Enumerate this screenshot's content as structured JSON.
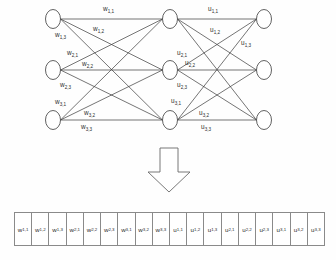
{
  "diagram": {
    "title_text": "",
    "type": "neural-network-weight-flattening",
    "colors": {
      "background": "#fefefe",
      "stroke": "#3a3a3a",
      "arrow_stroke": "#6a6a6a",
      "text": "#2b2b2b",
      "cell_border": "#8a8a8a"
    },
    "layers": [
      {
        "name": "input-layer",
        "node_count": 3,
        "x": 53,
        "nodes_y": [
          19,
          70,
          120
        ]
      },
      {
        "name": "hidden-layer",
        "node_count": 3,
        "x": 170,
        "nodes_y": [
          19,
          70,
          120
        ]
      },
      {
        "name": "output-layer",
        "node_count": 3,
        "x": 264,
        "nodes_y": [
          19,
          70,
          120
        ]
      }
    ],
    "node_radius": {
      "rx": 7.5,
      "ry": 9.5
    },
    "weight_labels_left": [
      {
        "base": "w",
        "sub": "1,1",
        "x": 103,
        "y": 6
      },
      {
        "base": "w",
        "sub": "1,2",
        "x": 93,
        "y": 26
      },
      {
        "base": "w",
        "sub": "1,3",
        "x": 55,
        "y": 32
      },
      {
        "base": "w",
        "sub": "2,1",
        "x": 67,
        "y": 50
      },
      {
        "base": "w",
        "sub": "2,2",
        "x": 82,
        "y": 61
      },
      {
        "base": "w",
        "sub": "2,3",
        "x": 60,
        "y": 82
      },
      {
        "base": "w",
        "sub": "3,1",
        "x": 55,
        "y": 99
      },
      {
        "base": "w",
        "sub": "3,2",
        "x": 84,
        "y": 110
      },
      {
        "base": "w",
        "sub": "3,3",
        "x": 81,
        "y": 124
      }
    ],
    "weight_labels_right": [
      {
        "base": "u",
        "sub": "1,1",
        "x": 208,
        "y": 6
      },
      {
        "base": "u",
        "sub": "1,2",
        "x": 210,
        "y": 27
      },
      {
        "base": "u",
        "sub": "1,3",
        "x": 241,
        "y": 40
      },
      {
        "base": "u",
        "sub": "2,1",
        "x": 177,
        "y": 50
      },
      {
        "base": "u",
        "sub": "2,2",
        "x": 185,
        "y": 60
      },
      {
        "base": "u",
        "sub": "2,3",
        "x": 177,
        "y": 82
      },
      {
        "base": "u",
        "sub": "3,1",
        "x": 171,
        "y": 98
      },
      {
        "base": "u",
        "sub": "3,2",
        "x": 199,
        "y": 110
      },
      {
        "base": "u",
        "sub": "3,3",
        "x": 201,
        "y": 124
      }
    ],
    "arrow": {
      "name": "downward-flow-arrow",
      "cx": 169,
      "top": 148,
      "bottom": 192,
      "shaft_half_width": 9,
      "head_half_width": 21,
      "head_top": 172
    },
    "vector_cells": [
      {
        "base": "w",
        "sub": "1,1"
      },
      {
        "base": "w",
        "sub": "1,2"
      },
      {
        "base": "w",
        "sub": "1,3"
      },
      {
        "base": "w",
        "sub": "2,1"
      },
      {
        "base": "w",
        "sub": "2,2"
      },
      {
        "base": "w",
        "sub": "2,3"
      },
      {
        "base": "w",
        "sub": "3,1"
      },
      {
        "base": "w",
        "sub": "3,2"
      },
      {
        "base": "w",
        "sub": "3,3"
      },
      {
        "base": "u",
        "sub": "1,1"
      },
      {
        "base": "u",
        "sub": "1,2"
      },
      {
        "base": "u",
        "sub": "1,3"
      },
      {
        "base": "u",
        "sub": "2,1"
      },
      {
        "base": "u",
        "sub": "2,2"
      },
      {
        "base": "u",
        "sub": "2,3"
      },
      {
        "base": "u",
        "sub": "3,1"
      },
      {
        "base": "u",
        "sub": "3,2"
      },
      {
        "base": "u",
        "sub": "3,3"
      }
    ]
  }
}
